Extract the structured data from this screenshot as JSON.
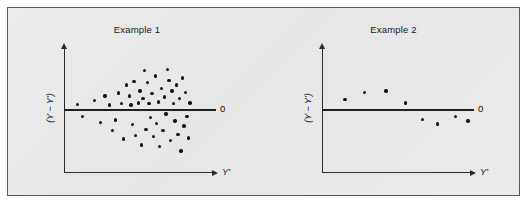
{
  "figure": {
    "background_color": "#e8e8e8",
    "border_color": "#5b5b5b"
  },
  "chart_data": [
    {
      "type": "scatter",
      "title": "Example 1",
      "xlabel": "Y'",
      "ylabel": "(Y − Y')",
      "reference_line_label": "0",
      "reference_line_value": 0,
      "grid": false,
      "legend": "none",
      "xlim": [
        0,
        100
      ],
      "ylim": [
        -100,
        100
      ],
      "description": "Residuals fan out with increasing Y' (heteroscedasticity / megaphone pattern)",
      "points": [
        {
          "x": 9,
          "y": 8
        },
        {
          "x": 12,
          "y": -12
        },
        {
          "x": 20,
          "y": 14
        },
        {
          "x": 24,
          "y": -22
        },
        {
          "x": 27,
          "y": 22
        },
        {
          "x": 30,
          "y": 7
        },
        {
          "x": 32,
          "y": -36
        },
        {
          "x": 34,
          "y": -18
        },
        {
          "x": 36,
          "y": 27
        },
        {
          "x": 38,
          "y": 9
        },
        {
          "x": 39,
          "y": -50
        },
        {
          "x": 41,
          "y": 40
        },
        {
          "x": 43,
          "y": 22
        },
        {
          "x": 44,
          "y": 7
        },
        {
          "x": 45,
          "y": -26
        },
        {
          "x": 46,
          "y": 46
        },
        {
          "x": 47,
          "y": -44
        },
        {
          "x": 49,
          "y": 10
        },
        {
          "x": 50,
          "y": 30
        },
        {
          "x": 51,
          "y": -60
        },
        {
          "x": 52,
          "y": 18
        },
        {
          "x": 53,
          "y": 64
        },
        {
          "x": 54,
          "y": -34
        },
        {
          "x": 55,
          "y": 44
        },
        {
          "x": 56,
          "y": 9
        },
        {
          "x": 57,
          "y": -14
        },
        {
          "x": 58,
          "y": 26
        },
        {
          "x": 59,
          "y": -46
        },
        {
          "x": 60,
          "y": 55
        },
        {
          "x": 61,
          "y": -24
        },
        {
          "x": 62,
          "y": 12
        },
        {
          "x": 63,
          "y": -62
        },
        {
          "x": 64,
          "y": 34
        },
        {
          "x": 65,
          "y": -36
        },
        {
          "x": 66,
          "y": 20
        },
        {
          "x": 67,
          "y": -8
        },
        {
          "x": 68,
          "y": 66
        },
        {
          "x": 69,
          "y": 48
        },
        {
          "x": 70,
          "y": -52
        },
        {
          "x": 71,
          "y": 30
        },
        {
          "x": 72,
          "y": 9
        },
        {
          "x": 73,
          "y": -20
        },
        {
          "x": 74,
          "y": 40
        },
        {
          "x": 75,
          "y": -42
        },
        {
          "x": 76,
          "y": 18
        },
        {
          "x": 77,
          "y": -70
        },
        {
          "x": 78,
          "y": 52
        },
        {
          "x": 79,
          "y": -28
        },
        {
          "x": 80,
          "y": 28
        },
        {
          "x": 81,
          "y": -12
        },
        {
          "x": 82,
          "y": -48
        },
        {
          "x": 83,
          "y": 10
        }
      ]
    },
    {
      "type": "scatter",
      "title": "Example 2",
      "xlabel": "Y'",
      "ylabel": "(Y − Y')",
      "reference_line_label": "0",
      "reference_line_value": 0,
      "grid": false,
      "legend": "none",
      "xlim": [
        0,
        100
      ],
      "ylim": [
        -100,
        100
      ],
      "description": "Residuals follow a curved inverted-U pattern (non-linearity)",
      "points": [
        {
          "x": 15,
          "y": 16
        },
        {
          "x": 28,
          "y": 28
        },
        {
          "x": 42,
          "y": 30
        },
        {
          "x": 55,
          "y": 10
        },
        {
          "x": 66,
          "y": -17
        },
        {
          "x": 76,
          "y": -25
        },
        {
          "x": 88,
          "y": -12
        },
        {
          "x": 96,
          "y": -20
        }
      ]
    }
  ]
}
